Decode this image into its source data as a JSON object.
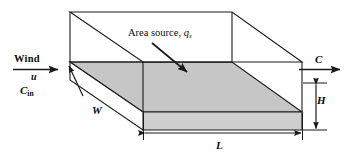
{
  "figure": {
    "name": "box-model-air-shed-diagram",
    "colors": {
      "outline": "#1a1a1a",
      "shaded_face": "#c9c9c9",
      "shaded_top": "#c6c6c6",
      "background": "#ffffff",
      "text": "#0d0d0d"
    }
  },
  "labels": {
    "wind": "Wind",
    "wind_speed": "u",
    "inflow_concentration": "C",
    "inflow_concentration_subscript": "in",
    "area_source_prefix": "Area source, ",
    "area_source_symbol": "q",
    "area_source_subscript": "s",
    "outflow_concentration": "C",
    "height": "H",
    "width": "W",
    "length": "L"
  },
  "icons": {
    "wind_arrow": "arrow-right-icon",
    "outflow_arrow": "arrow-right-icon",
    "source_pointer": "arrow-diagonal-down-right-icon",
    "height_dimension": "double-headed-arrow-vertical-icon",
    "length_dimension": "double-headed-arrow-horizontal-icon",
    "width_dimension": "arrow-diagonal-icon"
  }
}
